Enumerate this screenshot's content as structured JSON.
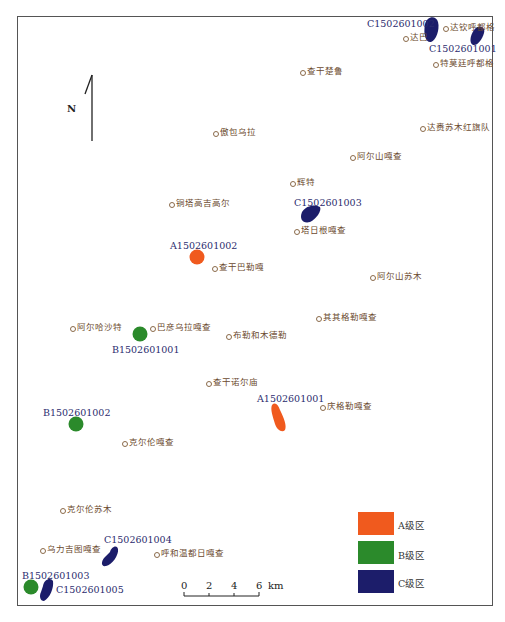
{
  "colors": {
    "zone_a": "#f05a1e",
    "zone_b": "#2b8a2b",
    "zone_c": "#1c1d6a",
    "place_text": "#6b4a2e",
    "code_text": "#2b2c6e"
  },
  "north_arrow": {
    "label": "N"
  },
  "places": [
    {
      "name": "达巴",
      "x": 403,
      "y": 32
    },
    {
      "name": "达钦呼都格",
      "x": 443,
      "y": 22
    },
    {
      "name": "特莫廷呼都格",
      "x": 433,
      "y": 58
    },
    {
      "name": "查干楚鲁",
      "x": 300,
      "y": 66
    },
    {
      "name": "傲包乌拉",
      "x": 213,
      "y": 127
    },
    {
      "name": "达赉苏木红旗队",
      "x": 420,
      "y": 122
    },
    {
      "name": "阿尔山嘎查",
      "x": 350,
      "y": 151
    },
    {
      "name": "辉特",
      "x": 290,
      "y": 177
    },
    {
      "name": "铜塔高吉高尔",
      "x": 169,
      "y": 198
    },
    {
      "name": "塔日根嘎查",
      "x": 294,
      "y": 225
    },
    {
      "name": "查干巴勒嘎",
      "x": 212,
      "y": 262
    },
    {
      "name": "阿尔山苏木",
      "x": 370,
      "y": 271
    },
    {
      "name": "其其格勒嘎查",
      "x": 316,
      "y": 312
    },
    {
      "name": "阿尔哈沙特",
      "x": 70,
      "y": 322
    },
    {
      "name": "巴彦乌拉嘎查",
      "x": 150,
      "y": 322
    },
    {
      "name": "布勒和木德勒",
      "x": 226,
      "y": 330
    },
    {
      "name": "查干诺尔庙",
      "x": 206,
      "y": 377
    },
    {
      "name": "庆格勒嘎查",
      "x": 320,
      "y": 401
    },
    {
      "name": "克尔伦嘎查",
      "x": 122,
      "y": 437
    },
    {
      "name": "克尔伦苏木",
      "x": 60,
      "y": 504
    },
    {
      "name": "乌力吉图嘎查",
      "x": 40,
      "y": 544
    },
    {
      "name": "呼和温都日嘎查",
      "x": 154,
      "y": 548
    }
  ],
  "zones": [
    {
      "code": "C1502601002",
      "grade": "C",
      "label_x": 367,
      "label_y": 18
    },
    {
      "code": "C1502601001",
      "grade": "C",
      "label_x": 429,
      "label_y": 43
    },
    {
      "code": "C1502601003",
      "grade": "C",
      "label_x": 294,
      "label_y": 197
    },
    {
      "code": "A1502601002",
      "grade": "A",
      "label_x": 170,
      "label_y": 240
    },
    {
      "code": "B1502601001",
      "grade": "B",
      "label_x": 112,
      "label_y": 344
    },
    {
      "code": "A1502601001",
      "grade": "A",
      "label_x": 257,
      "label_y": 393
    },
    {
      "code": "B1502601002",
      "grade": "B",
      "label_x": 43,
      "label_y": 407
    },
    {
      "code": "C1502601004",
      "grade": "C",
      "label_x": 104,
      "label_y": 534
    },
    {
      "code": "B1502601003",
      "grade": "B",
      "label_x": 22,
      "label_y": 570
    },
    {
      "code": "C1502601005",
      "grade": "C",
      "label_x": 56,
      "label_y": 584
    }
  ],
  "scale_bar": {
    "ticks": [
      "0",
      "2",
      "4",
      "6"
    ],
    "unit": "km"
  },
  "legend": {
    "items": [
      {
        "label": "A级区",
        "color": "#f05a1e"
      },
      {
        "label": "B级区",
        "color": "#2b8a2b"
      },
      {
        "label": "C级区",
        "color": "#1c1d6a"
      }
    ]
  }
}
